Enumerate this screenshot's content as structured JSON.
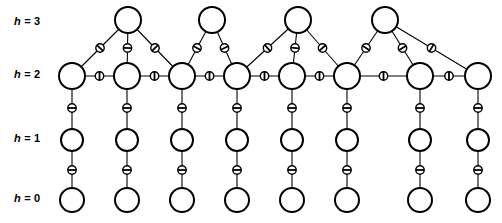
{
  "figure": {
    "type": "diagram",
    "background_color": "#ffffff",
    "node_stroke_color": "#000000",
    "node_fill_color": "#ffffff",
    "edge_color": "#000000",
    "marker_fill_color": "#ffffff"
  },
  "row_labels": [
    {
      "id": "h3",
      "var": "h",
      "eq": "=",
      "num": "3",
      "text": "h = 3",
      "y": 22
    },
    {
      "id": "h2",
      "var": "h",
      "eq": "=",
      "num": "2",
      "text": "h = 2",
      "y": 75
    },
    {
      "id": "h1",
      "var": "h",
      "eq": "=",
      "num": "1",
      "text": "h = 1",
      "y": 139
    },
    {
      "id": "h0",
      "var": "h",
      "eq": "=",
      "num": "0",
      "text": "h = 0",
      "y": 199
    }
  ],
  "levels": {
    "h3": {
      "y": 20,
      "radius": 13,
      "count": 4,
      "x": [
        128,
        212,
        298,
        385
      ]
    },
    "h2": {
      "y": 76,
      "radius": 13,
      "count": 8,
      "x": [
        72,
        127,
        182,
        237,
        292,
        347,
        420,
        478
      ]
    },
    "h1": {
      "y": 140,
      "radius": 11,
      "count": 8,
      "x": [
        72,
        127,
        182,
        237,
        292,
        347,
        420,
        478
      ]
    },
    "h0": {
      "y": 200,
      "radius": 12,
      "count": 8,
      "x": [
        72,
        127,
        182,
        237,
        292,
        347,
        420,
        478
      ]
    }
  },
  "edges": {
    "h2_chain": [
      {
        "from": 0,
        "to": 1
      },
      {
        "from": 1,
        "to": 2
      },
      {
        "from": 2,
        "to": 3
      },
      {
        "from": 3,
        "to": 4
      },
      {
        "from": 4,
        "to": 5
      },
      {
        "from": 5,
        "to": 6
      },
      {
        "from": 6,
        "to": 7
      }
    ],
    "h3_to_h2": [
      {
        "top": 0,
        "bottom": 0
      },
      {
        "top": 0,
        "bottom": 1
      },
      {
        "top": 0,
        "bottom": 2
      },
      {
        "top": 1,
        "bottom": 2
      },
      {
        "top": 1,
        "bottom": 3
      },
      {
        "top": 2,
        "bottom": 3
      },
      {
        "top": 2,
        "bottom": 4
      },
      {
        "top": 2,
        "bottom": 5
      },
      {
        "top": 3,
        "bottom": 5
      },
      {
        "top": 3,
        "bottom": 6
      },
      {
        "top": 3,
        "bottom": 7
      }
    ],
    "h2_to_h1": [
      0,
      1,
      2,
      3,
      4,
      5,
      6,
      7
    ],
    "h1_to_h0": [
      0,
      1,
      2,
      3,
      4,
      5,
      6,
      7
    ]
  },
  "edge_marker": {
    "radius": 4.2,
    "bar_half_length": 4.2,
    "orientation_rule": "bar drawn perpendicular to the edge direction"
  }
}
